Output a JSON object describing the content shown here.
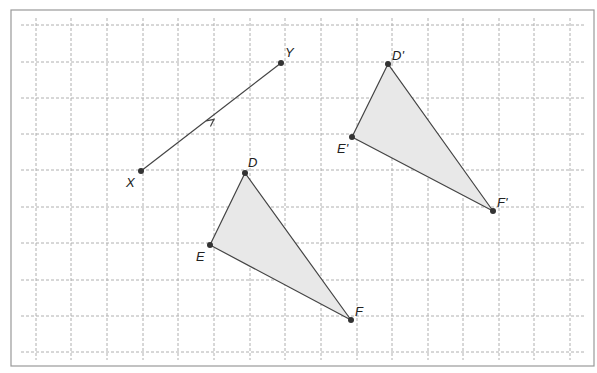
{
  "diagram": {
    "type": "translation-on-grid",
    "frame": {
      "x": 11,
      "y": 10,
      "w": 583,
      "h": 356,
      "stroke": "#999999"
    },
    "grid": {
      "xs": [
        36,
        71,
        107,
        143,
        178,
        214,
        250,
        285,
        321,
        357,
        392,
        428,
        463,
        499,
        534,
        570
      ],
      "ys": [
        25,
        62,
        98,
        134,
        170,
        207,
        243,
        280,
        316,
        352
      ],
      "color": "#b0b0b0"
    },
    "vector": {
      "from": "X",
      "to": "Y"
    },
    "points": {
      "X": {
        "x": 141,
        "y": 171,
        "label": "X",
        "lx": 126,
        "ly": 187
      },
      "Y": {
        "x": 281,
        "y": 63,
        "label": "Y",
        "lx": 285,
        "ly": 57
      },
      "D": {
        "x": 245,
        "y": 173,
        "label": "D",
        "lx": 248,
        "ly": 167
      },
      "E": {
        "x": 210,
        "y": 245,
        "label": "E",
        "lx": 196,
        "ly": 261
      },
      "F": {
        "x": 351,
        "y": 320,
        "label": "F",
        "lx": 355,
        "ly": 316
      },
      "D'": {
        "x": 388,
        "y": 64,
        "label": "D'",
        "lx": 392,
        "ly": 60
      },
      "E'": {
        "x": 352,
        "y": 137,
        "label": "E'",
        "lx": 337,
        "ly": 153
      },
      "F'": {
        "x": 493,
        "y": 211,
        "label": "F'",
        "lx": 497,
        "ly": 207
      }
    },
    "triangles": [
      {
        "name": "DEF",
        "vertices": [
          "D",
          "E",
          "F"
        ]
      },
      {
        "name": "D'E'F'",
        "vertices": [
          "D'",
          "E'",
          "F'"
        ]
      }
    ],
    "fill": "#e8e8e8",
    "stroke": "#444444"
  }
}
